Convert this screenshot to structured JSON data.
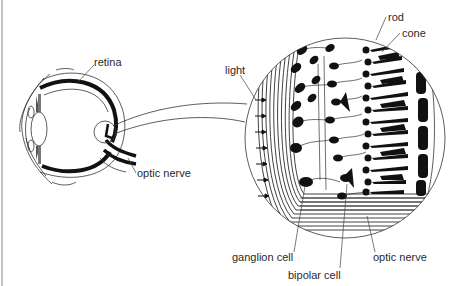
{
  "figure": {
    "labels": {
      "retina": "retina",
      "optic_nerve_eye": "optic nerve",
      "light": "light",
      "rod": "rod",
      "cone": "cone",
      "ganglion_cell": "ganglion cell",
      "bipolar_cell": "bipolar cell",
      "optic_nerve_retina": "optic nerve"
    },
    "light_arrow_count": 7,
    "colors": {
      "ink": "#111111",
      "label": "#2a2a2a",
      "background": "#ffffff",
      "frame": "#9a9a9a"
    }
  }
}
